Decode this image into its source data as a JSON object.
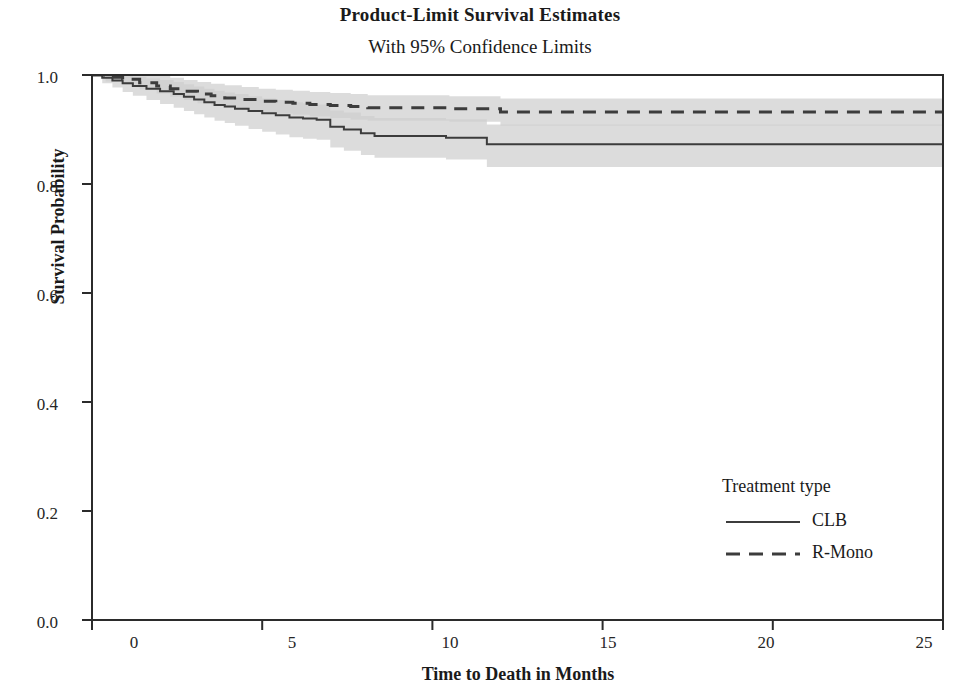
{
  "chart_data": {
    "type": "line",
    "title": "Product-Limit Survival Estimates",
    "subtitle": "With 95% Confidence Limits",
    "xlabel": "Time to Death in Months",
    "ylabel": "Survival Probability",
    "xlim": [
      0,
      25
    ],
    "ylim": [
      0.0,
      1.0
    ],
    "xticks": [
      "0",
      "5",
      "10",
      "15",
      "20",
      "25"
    ],
    "xtick_values": [
      0,
      5,
      10,
      15,
      20,
      25
    ],
    "yticks": [
      "0.0",
      "0.2",
      "0.4",
      "0.6",
      "0.8",
      "1.0"
    ],
    "ytick_values": [
      0.0,
      0.2,
      0.4,
      0.6,
      0.8,
      1.0
    ],
    "grid": false,
    "legend": {
      "title": "Treatment type",
      "position": "inside-bottom-right",
      "entries": [
        {
          "name": "CLB",
          "style": "solid"
        },
        {
          "name": "R-Mono",
          "style": "dashed"
        }
      ]
    },
    "confidence_level": "95%",
    "band_color": "#cfcfcf",
    "band_overlap_color": "#b4b4b4",
    "line_color": "#3c3c3c",
    "series": [
      {
        "name": "CLB",
        "style": "solid",
        "step": true,
        "x": [
          0,
          0.3,
          0.6,
          0.9,
          1.2,
          1.6,
          2.0,
          2.4,
          2.7,
          3.0,
          3.3,
          3.6,
          3.9,
          4.2,
          4.6,
          5.0,
          5.4,
          5.8,
          6.2,
          6.6,
          7.0,
          7.4,
          7.9,
          8.3,
          9.2,
          10.4,
          11.6,
          13.0,
          18.0,
          25.0
        ],
        "values": [
          1.0,
          0.995,
          0.99,
          0.985,
          0.98,
          0.975,
          0.97,
          0.965,
          0.96,
          0.955,
          0.95,
          0.945,
          0.942,
          0.938,
          0.934,
          0.93,
          0.926,
          0.922,
          0.92,
          0.918,
          0.905,
          0.9,
          0.893,
          0.888,
          0.888,
          0.885,
          0.873,
          0.873,
          0.873,
          0.873
        ],
        "upper": [
          1.0,
          1.0,
          1.0,
          0.999,
          0.997,
          0.994,
          0.991,
          0.987,
          0.983,
          0.979,
          0.975,
          0.971,
          0.968,
          0.965,
          0.961,
          0.957,
          0.954,
          0.95,
          0.948,
          0.946,
          0.935,
          0.931,
          0.925,
          0.921,
          0.921,
          0.919,
          0.909,
          0.909,
          0.909,
          0.909
        ],
        "lower": [
          1.0,
          0.985,
          0.977,
          0.969,
          0.962,
          0.954,
          0.947,
          0.94,
          0.934,
          0.928,
          0.922,
          0.916,
          0.912,
          0.907,
          0.901,
          0.896,
          0.891,
          0.886,
          0.883,
          0.881,
          0.867,
          0.861,
          0.853,
          0.848,
          0.848,
          0.845,
          0.831,
          0.831,
          0.831,
          0.831
        ]
      },
      {
        "name": "R-Mono",
        "style": "dashed",
        "step": true,
        "x": [
          0,
          0.4,
          0.9,
          1.4,
          1.9,
          2.3,
          2.7,
          3.1,
          3.5,
          3.9,
          4.4,
          4.9,
          5.4,
          5.9,
          6.4,
          7.0,
          7.6,
          8.1,
          9.0,
          10.5,
          12.0,
          16.0,
          20.0,
          25.0
        ],
        "values": [
          1.0,
          0.996,
          0.992,
          0.986,
          0.98,
          0.975,
          0.97,
          0.965,
          0.962,
          0.958,
          0.955,
          0.952,
          0.95,
          0.948,
          0.946,
          0.944,
          0.942,
          0.94,
          0.94,
          0.938,
          0.932,
          0.932,
          0.932,
          0.932
        ],
        "upper": [
          1.0,
          1.0,
          1.0,
          1.0,
          0.998,
          0.995,
          0.991,
          0.987,
          0.984,
          0.981,
          0.978,
          0.975,
          0.973,
          0.971,
          0.969,
          0.967,
          0.965,
          0.963,
          0.963,
          0.961,
          0.957,
          0.957,
          0.957,
          0.957
        ],
        "lower": [
          1.0,
          0.988,
          0.982,
          0.974,
          0.966,
          0.96,
          0.954,
          0.948,
          0.944,
          0.94,
          0.936,
          0.932,
          0.929,
          0.927,
          0.924,
          0.921,
          0.918,
          0.916,
          0.916,
          0.914,
          0.907,
          0.907,
          0.907,
          0.907
        ]
      }
    ]
  }
}
